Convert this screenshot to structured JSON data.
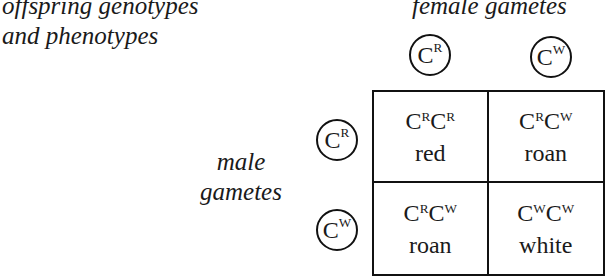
{
  "title": {
    "line1": "offspring genotypes",
    "line2": "and phenotypes"
  },
  "female": {
    "label": "female gametes",
    "alleles": [
      {
        "base": "C",
        "sup": "R"
      },
      {
        "base": "C",
        "sup": "W"
      }
    ]
  },
  "male": {
    "label_line1": "male",
    "label_line2": "gametes",
    "alleles": [
      {
        "base": "C",
        "sup": "R"
      },
      {
        "base": "C",
        "sup": "W"
      }
    ]
  },
  "grid": {
    "rows": [
      [
        {
          "a1": "C",
          "s1": "R",
          "a2": "C",
          "s2": "R",
          "phenotype": "red"
        },
        {
          "a1": "C",
          "s1": "R",
          "a2": "C",
          "s2": "W",
          "phenotype": "roan"
        }
      ],
      [
        {
          "a1": "C",
          "s1": "R",
          "a2": "C",
          "s2": "W",
          "phenotype": "roan"
        },
        {
          "a1": "C",
          "s1": "W",
          "a2": "C",
          "s2": "W",
          "phenotype": "white"
        }
      ]
    ]
  }
}
